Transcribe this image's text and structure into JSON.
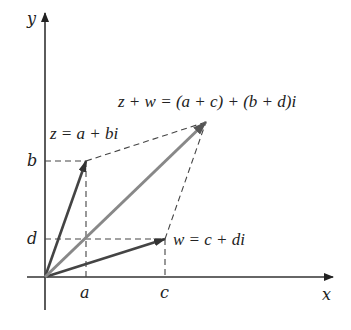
{
  "diagram": {
    "axes": {
      "x_label": "x",
      "y_label": "y"
    },
    "tick_labels": {
      "x": [
        "a",
        "c"
      ],
      "y": [
        "b",
        "d"
      ]
    },
    "vectors": [
      {
        "name": "z",
        "label": "z = a + bi"
      },
      {
        "name": "w",
        "label": "w = c + di"
      },
      {
        "name": "z_plus_w",
        "label": "z + w = (a + c) + (b + d)i"
      }
    ],
    "colors": {
      "axis": "#333333",
      "vector": "#444444",
      "sum_vector": "#808080",
      "dashed": "#444444"
    }
  }
}
